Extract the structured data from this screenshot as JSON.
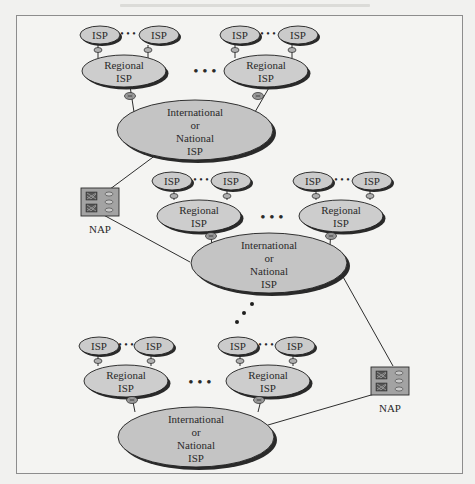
{
  "figure": {
    "colors": {
      "ellipse_fill": "#cbcbcb",
      "ellipse_stroke": "#1e1e1e",
      "shadow": "#2a2a2a",
      "nap_fill": "#a3a3a3",
      "line": "#2e2e2e",
      "background": "#f4f4f2"
    },
    "labels": {
      "isp": "ISP",
      "regional_line1": "Regional",
      "regional_line2": "ISP",
      "intl_line1": "International",
      "intl_line2": "or",
      "intl_line3": "National",
      "intl_line4": "ISP",
      "nap": "NAP",
      "ellipsis": "• • •"
    },
    "clusters": [
      {
        "name": "cluster-top",
        "regional_isps": [
          {
            "local_isps": [
              "ISP",
              "ISP"
            ]
          },
          {
            "local_isps": [
              "ISP",
              "ISP"
            ]
          }
        ],
        "backbone": "International or National ISP"
      },
      {
        "name": "cluster-middle",
        "regional_isps": [
          {
            "local_isps": [
              "ISP",
              "ISP"
            ]
          },
          {
            "local_isps": [
              "ISP",
              "ISP"
            ]
          }
        ],
        "backbone": "International or National ISP"
      },
      {
        "name": "cluster-bottom",
        "regional_isps": [
          {
            "local_isps": [
              "ISP",
              "ISP"
            ]
          },
          {
            "local_isps": [
              "ISP",
              "ISP"
            ]
          }
        ],
        "backbone": "International or National ISP"
      }
    ],
    "naps": [
      {
        "label": "NAP",
        "connects": [
          "cluster-top",
          "cluster-middle"
        ]
      },
      {
        "label": "NAP",
        "connects": [
          "cluster-middle",
          "cluster-bottom"
        ]
      }
    ]
  }
}
